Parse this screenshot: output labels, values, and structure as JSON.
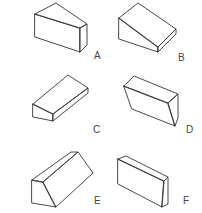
{
  "figure": {
    "stroke_color": "#333333",
    "label_color": "#444444",
    "shapes": [
      {
        "label": "A",
        "kind": "wedge-truncated-prism"
      },
      {
        "label": "B",
        "kind": "inclined-wedge-prism"
      },
      {
        "label": "C",
        "kind": "long-wedge-prism"
      },
      {
        "label": "D",
        "kind": "slanted-block"
      },
      {
        "label": "E",
        "kind": "triangular-prism-with-flat-top"
      },
      {
        "label": "F",
        "kind": "rectangular-block"
      }
    ]
  }
}
